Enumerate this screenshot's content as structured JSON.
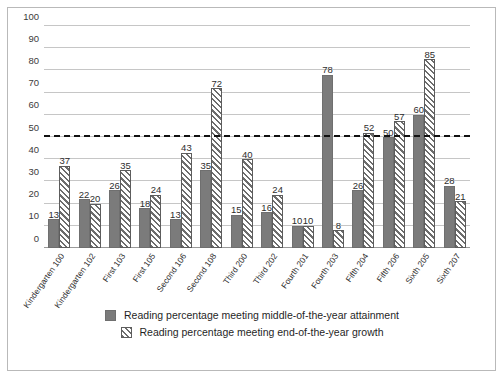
{
  "chart_data": {
    "type": "bar",
    "title": "",
    "subtitle": "",
    "xlabel": "",
    "ylabel": "",
    "ylim": [
      0,
      100
    ],
    "ytick_step": 10,
    "yticks": [
      0,
      10,
      20,
      30,
      40,
      50,
      60,
      70,
      80,
      90,
      100
    ],
    "grid": true,
    "legend_position": "bottom",
    "categories": [
      "Kindergarten 100",
      "Kindergarten 102",
      "First 103",
      "First 105",
      "Second 106",
      "Second 108",
      "Third 200",
      "Third 202",
      "Fourth 201",
      "Fourth 203",
      "Fifth 204",
      "Fifth 206",
      "Sixth 205",
      "Sixth 207"
    ],
    "series": [
      {
        "name": "Reading percentage meeting middle-of-the-year attainment",
        "style": "solid",
        "color": "#7b7b7b",
        "values": [
          13,
          22,
          26,
          18,
          13,
          35,
          15,
          16,
          10,
          78,
          26,
          50,
          60,
          28
        ]
      },
      {
        "name": "Reading percentage meeting end-of-the-year growth",
        "style": "hatch",
        "color": "#6d6d6d",
        "values": [
          37,
          20,
          35,
          24,
          43,
          72,
          40,
          24,
          10,
          8,
          52,
          57,
          85,
          21
        ]
      }
    ],
    "annotations": [
      {
        "type": "threshold-line",
        "value": 50,
        "style": "dashed",
        "color": "#111111"
      }
    ]
  },
  "legend": {
    "items": [
      {
        "label": "Reading percentage meeting middle-of-the-year attainment",
        "swatch": "solid-gray-swatch"
      },
      {
        "label": "Reading percentage meeting end-of-the-year growth",
        "swatch": "hatched-gray-swatch"
      }
    ]
  }
}
